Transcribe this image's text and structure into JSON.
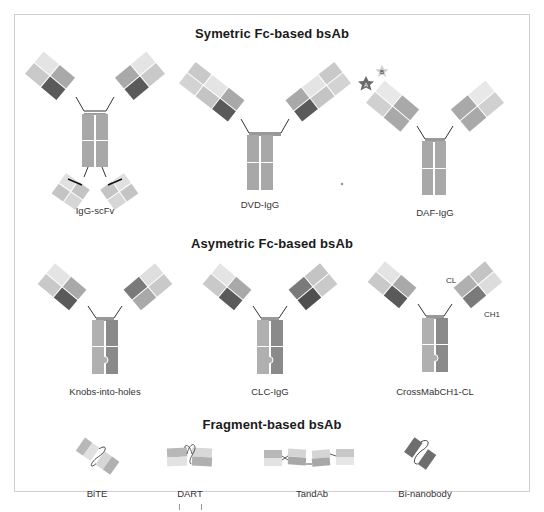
{
  "figure": {
    "sections": [
      {
        "title": "Symetric Fc-based bsAb",
        "formats": [
          {
            "name": "IgG-scFv"
          },
          {
            "name": "DVD-IgG"
          },
          {
            "name": "DAF-IgG",
            "antigen_labels": [
              "A",
              "B"
            ]
          }
        ]
      },
      {
        "title": "Asymetric Fc-based bsAb",
        "formats": [
          {
            "name": "Knobs-into-holes"
          },
          {
            "name": "CLC-IgG"
          },
          {
            "name": "CrossMabCH1-CL",
            "domain_labels": [
              "CL",
              "CH1"
            ]
          }
        ]
      },
      {
        "title": "Fragment-based bsAb",
        "formats": [
          {
            "name": "BiTE"
          },
          {
            "name": "DART"
          },
          {
            "name": "TandAb"
          },
          {
            "name": "Bi-nanobody"
          }
        ]
      }
    ],
    "colors": {
      "very_light": "#e4e4e4",
      "light": "#c9c9c9",
      "medium": "#a9a9a9",
      "dark": "#5a5a5a",
      "fc": "#a8a8a8",
      "fc_dark": "#8c8c8c",
      "star_dark": "#6a6a6a",
      "star_light": "#cfcfcf",
      "frame_border": "#cfcfcf"
    }
  }
}
